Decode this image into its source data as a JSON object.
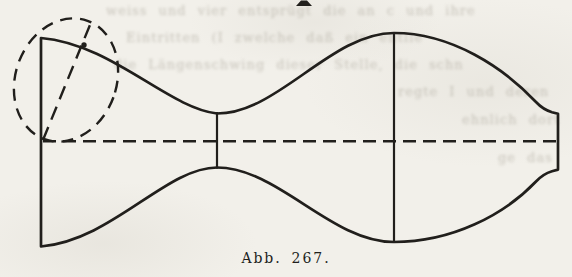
{
  "page": {
    "background_color": "#f2f0ea",
    "ink_color": "#211f1c",
    "bleedthrough_color": "#a39e92"
  },
  "figure": {
    "caption": "Abb. 267.",
    "elements": {
      "envelope": "standing-wave-envelope-outline",
      "axis": "dashed-center-axis",
      "ellipse": "dashed-orbit-ellipse",
      "diagonal": "dashed-diagonal-chord",
      "node_line": "node-vertical-line",
      "antinode_line": "antinode-vertical-line"
    }
  },
  "bleedthrough_text_fragments": [
    "weiss und vier  entsprügt  die an c  und ihre",
    "Eintritten (I  zwelche   daß ein   entlie",
    "die Längenschwing dieser Stelle,  die schn",
    "regte I und deren",
    "ehnlich dort",
    "ge das"
  ]
}
